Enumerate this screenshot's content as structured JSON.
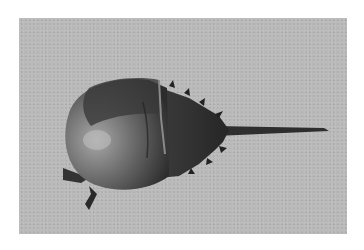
{
  "image": {
    "subject": "horseshoe crab on sand",
    "alt": "Black-and-white photograph of a horseshoe crab resting on sand"
  },
  "colors": {
    "background": "#ffffff",
    "sand": "#b9b9b9",
    "carapace_light": "#9a9a9a",
    "carapace_dark": "#3a3a3a",
    "tail": "#2e2e2e"
  }
}
